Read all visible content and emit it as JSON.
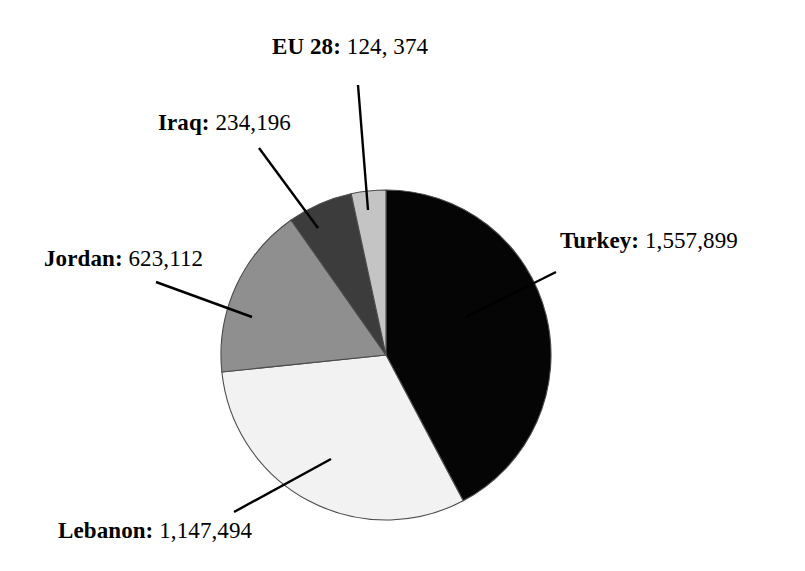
{
  "chart_data": {
    "type": "pie",
    "title": "",
    "subtitle": "",
    "xlabel": "",
    "ylabel": "",
    "legend_position": "none",
    "grid": false,
    "total": 3687075,
    "label_format": "NAME: VALUE",
    "categories": [
      "Turkey",
      "Lebanon",
      "Jordan",
      "Iraq",
      "EU 28"
    ],
    "values": [
      1557899,
      1147494,
      623112,
      234196,
      124374
    ],
    "value_labels": [
      "1,557,899",
      "1,147,494",
      "623,112",
      "234,196",
      "124, 374"
    ],
    "percentages": [
      42.25,
      31.12,
      16.9,
      6.35,
      3.37
    ],
    "colors": [
      "#050505",
      "#f2f2f2",
      "#8f8f8f",
      "#3c3c3c",
      "#c4c4c4"
    ],
    "start_angle_deg": 0,
    "direction": "clockwise",
    "slices": [
      {
        "name": "Turkey",
        "value": 1557899,
        "value_label": "1,557,899",
        "label_text": "Turkey: 1,557,899",
        "percent": 42.25,
        "color": "#050505",
        "start_deg": 0,
        "end_deg": 152.1,
        "leader_label_x": 556,
        "leader_label_y": 272,
        "leader_tip_x": 466,
        "leader_tip_y": 317
      },
      {
        "name": "Lebanon",
        "value": 1147494,
        "value_label": "1,147,494",
        "label_text": "Lebanon: 1,147,494",
        "percent": 31.12,
        "color": "#f2f2f2",
        "start_deg": 152.1,
        "end_deg": 264.1,
        "leader_label_x": 234,
        "leader_label_y": 512,
        "leader_tip_x": 331,
        "leader_tip_y": 459
      },
      {
        "name": "Jordan",
        "value": 623112,
        "value_label": "623,112",
        "label_text": "Jordan: 623,112",
        "percent": 16.9,
        "color": "#8f8f8f",
        "start_deg": 264.1,
        "end_deg": 324.9,
        "leader_label_x": 156,
        "leader_label_y": 282,
        "leader_tip_x": 252,
        "leader_tip_y": 317
      },
      {
        "name": "Iraq",
        "value": 234196,
        "value_label": "234,196",
        "label_text": "Iraq: 234,196",
        "percent": 6.35,
        "color": "#3c3c3c",
        "start_deg": 324.9,
        "end_deg": 347.8,
        "leader_label_x": 259,
        "leader_label_y": 148,
        "leader_tip_x": 318,
        "leader_tip_y": 228
      },
      {
        "name": "EU 28",
        "value": 124374,
        "value_label": "124, 374",
        "label_text": "EU 28: 124, 374",
        "percent": 3.37,
        "color": "#c4c4c4",
        "start_deg": 347.8,
        "end_deg": 360,
        "leader_label_x": 358,
        "leader_label_y": 85,
        "leader_tip_x": 368,
        "leader_tip_y": 210
      }
    ],
    "geometry": {
      "center_x": 386,
      "center_y": 355,
      "radius": 165,
      "outline_color": "#4a4a4a"
    }
  },
  "labels": {
    "turkey": {
      "name": "Turkey:",
      "value": "1,557,899"
    },
    "lebanon": {
      "name": "Lebanon:",
      "value": "1,147,494"
    },
    "jordan": {
      "name": "Jordan:",
      "value": "623,112"
    },
    "iraq": {
      "name": "Iraq:",
      "value": "234,196"
    },
    "eu28": {
      "name": "EU 28:",
      "value": "124, 374"
    }
  }
}
